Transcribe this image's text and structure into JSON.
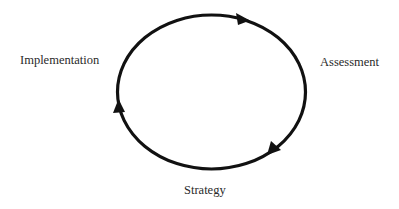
{
  "diagram": {
    "type": "cycle",
    "direction": "clockwise",
    "stroke_color": "#111111",
    "text_color": "#2a2a2a",
    "background": "#ffffff",
    "nodes": [
      {
        "label": "Assessment",
        "position": "right"
      },
      {
        "label": "Strategy",
        "position": "bottom"
      },
      {
        "label": "Implementation",
        "position": "left"
      }
    ],
    "arrows": [
      {
        "location": "top-right",
        "pointing": "right"
      },
      {
        "location": "bottom-right",
        "pointing": "down-left"
      },
      {
        "location": "left",
        "pointing": "up"
      }
    ]
  }
}
